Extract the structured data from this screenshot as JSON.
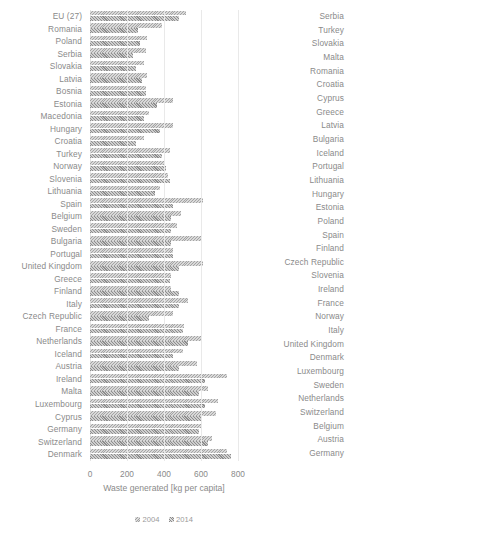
{
  "chart_data": [
    {
      "type": "bar",
      "orientation": "horizontal",
      "title": "",
      "xlabel": "Waste generated [kg per capita]",
      "ylabel": "",
      "xlim": [
        0,
        800
      ],
      "xticks": [
        0,
        200,
        400,
        600,
        800
      ],
      "xtick_labels": [
        "0",
        "200",
        "400",
        "600",
        "800"
      ],
      "grid": "vertical",
      "legend_position": "below",
      "categories": [
        "EU (27)",
        "Romania",
        "Poland",
        "Serbia",
        "Slovakia",
        "Latvia",
        "Bosnia",
        "Estonia",
        "Macedonia",
        "Hungary",
        "Croatia",
        "Turkey",
        "Norway",
        "Slovenia",
        "Lithuania",
        "Spain",
        "Belgium",
        "Sweden",
        "Bulgaria",
        "Portugal",
        "United Kingdom",
        "Greece",
        "Finland",
        "Italy",
        "Czech Republic",
        "France",
        "Netherlands",
        "Iceland",
        "Austria",
        "Ireland",
        "Malta",
        "Luxembourg",
        "Cyprus",
        "Germany",
        "Switzerland",
        "Denmark"
      ],
      "series": [
        {
          "name": "2004",
          "values": [
            520,
            390,
            310,
            300,
            290,
            310,
            300,
            450,
            320,
            450,
            290,
            430,
            400,
            420,
            380,
            610,
            490,
            470,
            600,
            450,
            610,
            440,
            440,
            530,
            450,
            510,
            600,
            500,
            580,
            740,
            640,
            690,
            680,
            600,
            660,
            740
          ]
        },
        {
          "name": "2014",
          "values": [
            480,
            260,
            270,
            230,
            250,
            280,
            300,
            360,
            290,
            380,
            250,
            390,
            410,
            430,
            350,
            450,
            440,
            440,
            440,
            450,
            480,
            430,
            480,
            480,
            320,
            500,
            530,
            450,
            480,
            620,
            590,
            620,
            600,
            590,
            640,
            760
          ]
        }
      ]
    },
    {
      "type": "bar",
      "orientation": "horizontal",
      "title": "",
      "xlabel": "Recycling rate [%]",
      "ylabel": "",
      "xlim": [
        0,
        80
      ],
      "xticks": [
        0,
        20,
        40,
        60,
        80
      ],
      "xtick_labels": [
        "0",
        "20",
        "40",
        "60",
        "80"
      ],
      "grid": "vertical",
      "legend_position": "below",
      "categories": [
        "Serbia",
        "Turkey",
        "Slovakia",
        "Malta",
        "Romania",
        "Croatia",
        "Cyprus",
        "Greece",
        "Latvia",
        "Bulgaria",
        "Iceland",
        "Portugal",
        "Lithuania",
        "Hungary",
        "Estonia",
        "Poland",
        "Spain",
        "Finland",
        "Czech Republic",
        "Slovenia",
        "Ireland",
        "France",
        "Norway",
        "Italy",
        "United Kingdom",
        "Denmark",
        "Luxembourg",
        "Sweden",
        "Netherlands",
        "Switzerland",
        "Belgium",
        "Austria",
        "Germany"
      ],
      "series": [
        {
          "name": "2004",
          "values": [
            0.5,
            0.5,
            5,
            4,
            2,
            3,
            2,
            9,
            4,
            14,
            20,
            14,
            2,
            9,
            22,
            5,
            28,
            28,
            11,
            17,
            21,
            25,
            27,
            10,
            17,
            25,
            33,
            30,
            29,
            29,
            33,
            38,
            57
          ]
        },
        {
          "name": "2014",
          "values": [
            0.5,
            0.5,
            6,
            6,
            6,
            8,
            9,
            10,
            11,
            13,
            17,
            17,
            18,
            18,
            19,
            19,
            22,
            22,
            23,
            25,
            25,
            28,
            30,
            30,
            33,
            35,
            39,
            40,
            42,
            42,
            44,
            45,
            63
          ]
        }
      ]
    }
  ],
  "panels": [
    {
      "name": "waste-generated",
      "xlabel": "Waste generated [kg per capita]",
      "legend": [
        {
          "label": "2004"
        },
        {
          "label": "2014"
        }
      ]
    },
    {
      "name": "recycling-rate",
      "xlabel": "Recycling rate [%]",
      "legend": [
        {
          "label": "2004"
        },
        {
          "label": "2014"
        }
      ]
    }
  ],
  "colors": {
    "bar_2004": "#d9d9d9",
    "bar_2014": "#cfcfcf",
    "hatch": "#969696",
    "grid": "#e9e9e9",
    "text": "#8a8a8a",
    "background": "#ffffff"
  }
}
